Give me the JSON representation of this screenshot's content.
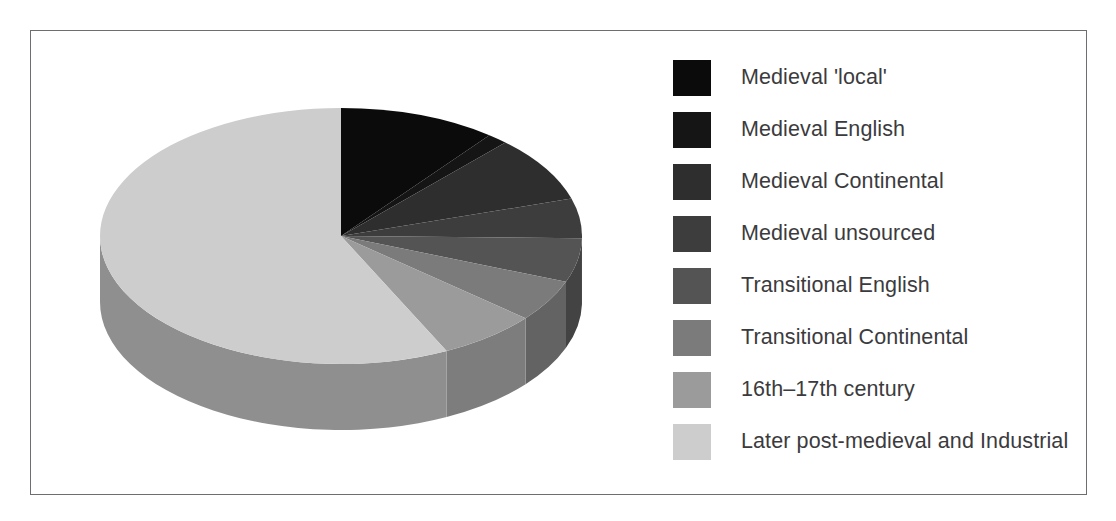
{
  "figure": {
    "frame_color": "#6e6e70",
    "background": "#ffffff"
  },
  "legend": {
    "position": "right",
    "items": [
      {
        "label": "Medieval 'local'",
        "color": "#0b0b0b"
      },
      {
        "label": "Medieval English",
        "color": "#151515"
      },
      {
        "label": "Medieval Continental",
        "color": "#2e2e2e"
      },
      {
        "label": "Medieval unsourced",
        "color": "#3d3d3d"
      },
      {
        "label": "Transitional English",
        "color": "#545454"
      },
      {
        "label": "Transitional Continental",
        "color": "#7b7b7b"
      },
      {
        "label": "16th–17th century",
        "color": "#9b9b9b"
      },
      {
        "label": "Later post-medieval and Industrial",
        "color": "#cdcdcd"
      }
    ]
  },
  "chart_data": {
    "type": "pie",
    "title": "",
    "subtitle": "",
    "xlabel": "",
    "ylabel": "",
    "grid": false,
    "legend_position": "right",
    "three_d": true,
    "start_angle_deg": 0,
    "direction": "clockwise",
    "categories": [
      "Medieval 'local'",
      "Medieval English",
      "Medieval Continental",
      "Medieval unsourced",
      "Transitional English",
      "Transitional Continental",
      "16th–17th century",
      "Later post-medieval and Industrial"
    ],
    "values": [
      10.6,
      1.4,
      8.3,
      5.0,
      5.6,
      5.3,
      6.7,
      57.1
    ],
    "units": "percent",
    "angles_deg": [
      38,
      5,
      30,
      18,
      20,
      19,
      24,
      206
    ],
    "colors": [
      "#0b0b0b",
      "#151515",
      "#2e2e2e",
      "#3d3d3d",
      "#545454",
      "#7b7b7b",
      "#9b9b9b",
      "#cdcdcd"
    ],
    "rim_colors": [
      "#060606",
      "#0f0f0f",
      "#242424",
      "#303030",
      "#434343",
      "#636363",
      "#7d7d7d",
      "#8f8f8f"
    ]
  },
  "geometry": {
    "center_x": 281,
    "center_y": 156,
    "radius_x": 241,
    "radius_y": 128,
    "depth": 66
  }
}
